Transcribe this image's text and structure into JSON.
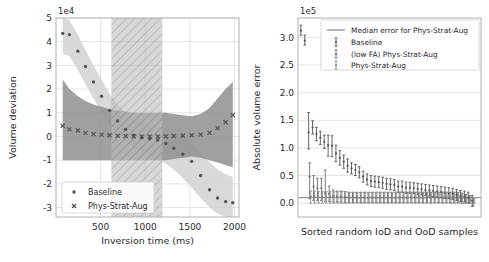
{
  "figure": {
    "background": "#ffffff",
    "width": 489,
    "height": 262
  },
  "chart_data": [
    {
      "id": "left",
      "type": "scatter",
      "title": "",
      "xlabel": "Inversion time (ms)",
      "ylabel": "Volume deviation",
      "x_exponent": "",
      "y_exponent": "1e4",
      "xlim": [
        0,
        2050
      ],
      "ylim": [
        -3.4,
        5.0
      ],
      "xticks": [
        500,
        1000,
        1500,
        2000
      ],
      "xticklabels": [
        "500",
        "1000",
        "1500",
        "2000"
      ],
      "yticks": [
        -3,
        -2,
        -1,
        0,
        1,
        2,
        3,
        4,
        5
      ],
      "yticklabels": [
        "-3",
        "-2",
        "-1",
        "0",
        "1",
        "2",
        "3",
        "4",
        "5"
      ],
      "grid": true,
      "legend_position": "lower left",
      "hatched_region": {
        "label": "training inversion time range",
        "x_start": 620,
        "x_end": 1190,
        "facecolor": "#bdbdbd",
        "hatch": "///"
      },
      "series": [
        {
          "name": "Baseline",
          "marker": "dot",
          "color": "#555555",
          "x": [
            75,
            150,
            245,
            330,
            420,
            510,
            600,
            690,
            780,
            870,
            960,
            1050,
            1140,
            1230,
            1320,
            1420,
            1520,
            1620,
            1720,
            1810,
            1900,
            1980
          ],
          "y": [
            4.35,
            4.3,
            3.6,
            2.95,
            2.3,
            1.7,
            1.1,
            0.65,
            0.3,
            0.05,
            -0.05,
            -0.1,
            -0.15,
            -0.3,
            -0.5,
            -0.75,
            -1.05,
            -1.65,
            -2.25,
            -2.6,
            -2.75,
            -2.8
          ],
          "band": {
            "name": "Baseline spread",
            "color": "#d2d2d2",
            "upper": [
              5.0,
              4.9,
              4.3,
              3.65,
              3.0,
              2.4,
              1.8,
              1.35,
              1.0,
              0.75,
              0.6,
              0.5,
              0.45,
              0.35,
              0.2,
              0.0,
              -0.3,
              -0.7,
              -1.1,
              -1.4,
              -1.6,
              -1.7
            ],
            "lower": [
              3.5,
              3.4,
              2.8,
              2.2,
              1.6,
              1.05,
              0.5,
              0.1,
              -0.25,
              -0.5,
              -0.65,
              -0.8,
              -0.95,
              -1.15,
              -1.4,
              -1.75,
              -2.15,
              -2.6,
              -3.0,
              -3.25,
              -3.4,
              -3.4
            ]
          }
        },
        {
          "name": "Phys-Strat-Aug",
          "marker": "x",
          "color": "#555555",
          "x": [
            75,
            150,
            245,
            330,
            420,
            510,
            600,
            690,
            780,
            870,
            960,
            1050,
            1140,
            1230,
            1320,
            1420,
            1520,
            1620,
            1720,
            1810,
            1900,
            1980
          ],
          "y": [
            0.45,
            0.3,
            0.25,
            0.15,
            0.1,
            0.08,
            0.05,
            0.03,
            0.02,
            0.0,
            0.0,
            0.0,
            0.0,
            0.0,
            0.02,
            0.03,
            0.05,
            0.08,
            0.15,
            0.35,
            0.6,
            0.9
          ],
          "band": {
            "name": "Phys-Strat-Aug spread",
            "color": "#8f8f8f",
            "upper": [
              2.4,
              2.0,
              1.7,
              1.5,
              1.35,
              1.25,
              1.15,
              1.1,
              1.05,
              1.0,
              1.0,
              1.0,
              1.0,
              1.0,
              0.95,
              0.9,
              0.85,
              0.95,
              1.2,
              1.6,
              2.0,
              2.3
            ],
            "lower": [
              -1.0,
              -1.0,
              -1.0,
              -1.0,
              -1.0,
              -1.0,
              -1.0,
              -1.0,
              -1.0,
              -1.0,
              -1.0,
              -1.0,
              -1.0,
              -1.0,
              -0.95,
              -0.9,
              -0.85,
              -0.9,
              -1.0,
              -1.1,
              -1.2,
              -1.3
            ]
          }
        }
      ],
      "legend": [
        {
          "label": "Baseline",
          "marker": "dot"
        },
        {
          "label": "Phys-Strat-Aug",
          "marker": "x"
        }
      ]
    },
    {
      "id": "right",
      "type": "scatter",
      "title": "",
      "xlabel": "Sorted random IoD and OoD samples",
      "ylabel": "Absolute volume error",
      "x_exponent": "",
      "y_exponent": "1e5",
      "xlim": [
        0,
        47
      ],
      "ylim": [
        -0.25,
        3.35
      ],
      "xticks": [],
      "xticklabels": [],
      "yticks": [
        0.0,
        0.5,
        1.0,
        1.5,
        2.0,
        2.5,
        3.0
      ],
      "yticklabels": [
        "0.0",
        "0.5",
        "1.0",
        "1.5",
        "2.0",
        "2.5",
        "3.0"
      ],
      "grid": true,
      "legend_position": "upper right",
      "median_line": {
        "label": "Median error for Phys-Strat-Aug",
        "value": 0.1,
        "color": "#7a7a7a"
      },
      "series": [
        {
          "name": "Baseline",
          "color": "#555555",
          "x": [
            1,
            2,
            3,
            4,
            5,
            6,
            7,
            8,
            9,
            10,
            11,
            12,
            13,
            14,
            15,
            16,
            17,
            18,
            19,
            20,
            21,
            22,
            23,
            24,
            25,
            26,
            27,
            28,
            29,
            30,
            31,
            32,
            33,
            34,
            35,
            36,
            37,
            38,
            39,
            40,
            41,
            42,
            43,
            44,
            45
          ],
          "y": [
            3.12,
            2.94,
            1.28,
            1.37,
            1.25,
            1.18,
            1.11,
            1.05,
            1.04,
            0.9,
            0.82,
            0.75,
            0.68,
            0.63,
            0.6,
            0.56,
            0.48,
            0.43,
            0.4,
            0.39,
            0.38,
            0.37,
            0.35,
            0.34,
            0.33,
            0.3,
            0.3,
            0.28,
            0.28,
            0.27,
            0.26,
            0.25,
            0.24,
            0.23,
            0.22,
            0.21,
            0.2,
            0.19,
            0.18,
            0.17,
            0.15,
            0.13,
            0.12,
            0.1,
            0.04
          ],
          "err_low": [
            0.08,
            0.08,
            0.3,
            0.12,
            0.12,
            0.12,
            0.12,
            0.2,
            0.2,
            0.15,
            0.13,
            0.12,
            0.12,
            0.1,
            0.1,
            0.1,
            0.1,
            0.1,
            0.1,
            0.1,
            0.1,
            0.1,
            0.1,
            0.1,
            0.1,
            0.1,
            0.1,
            0.1,
            0.1,
            0.1,
            0.1,
            0.1,
            0.1,
            0.1,
            0.1,
            0.1,
            0.1,
            0.1,
            0.1,
            0.1,
            0.1,
            0.1,
            0.1,
            0.1,
            0.1
          ],
          "err_high": [
            0.1,
            0.1,
            0.36,
            0.12,
            0.12,
            0.12,
            0.12,
            0.18,
            0.18,
            0.15,
            0.13,
            0.12,
            0.12,
            0.1,
            0.1,
            0.1,
            0.1,
            0.1,
            0.1,
            0.1,
            0.1,
            0.1,
            0.1,
            0.1,
            0.1,
            0.1,
            0.1,
            0.1,
            0.1,
            0.1,
            0.1,
            0.1,
            0.1,
            0.1,
            0.1,
            0.1,
            0.1,
            0.1,
            0.1,
            0.1,
            0.1,
            0.1,
            0.1,
            0.1,
            0.1
          ]
        },
        {
          "name": "(low FA) Phys-Strat-Aug",
          "color": "#6e6e6e",
          "x": [
            3,
            4,
            5,
            6,
            7,
            8,
            9,
            10,
            11,
            12,
            13,
            14,
            15,
            16,
            17,
            18,
            19,
            20,
            21,
            22,
            23,
            24,
            25,
            26,
            27,
            28,
            29,
            30,
            31,
            32,
            33,
            34,
            35,
            36,
            37,
            38,
            39,
            40,
            41,
            42,
            43,
            44,
            45
          ],
          "y": [
            0.48,
            0.3,
            0.27,
            0.27,
            0.18,
            0.17,
            0.13,
            0.12,
            0.12,
            0.11,
            0.1,
            0.1,
            0.1,
            0.1,
            0.1,
            0.1,
            0.1,
            0.1,
            0.1,
            0.1,
            0.1,
            0.1,
            0.1,
            0.1,
            0.1,
            0.1,
            0.1,
            0.1,
            0.1,
            0.1,
            0.1,
            0.1,
            0.1,
            0.1,
            0.1,
            0.1,
            0.1,
            0.1,
            0.1,
            0.09,
            0.08,
            0.07,
            0.02
          ],
          "err_low": [
            0.4,
            0.25,
            0.22,
            0.22,
            0.15,
            0.14,
            0.11,
            0.1,
            0.1,
            0.1,
            0.09,
            0.09,
            0.09,
            0.09,
            0.09,
            0.09,
            0.09,
            0.09,
            0.09,
            0.09,
            0.09,
            0.09,
            0.09,
            0.09,
            0.09,
            0.09,
            0.09,
            0.09,
            0.09,
            0.09,
            0.09,
            0.09,
            0.09,
            0.09,
            0.09,
            0.09,
            0.09,
            0.09,
            0.09,
            0.09,
            0.08,
            0.07,
            0.06
          ],
          "err_high": [
            0.25,
            0.2,
            0.18,
            0.18,
            0.42,
            0.14,
            0.11,
            0.1,
            0.1,
            0.1,
            0.09,
            0.09,
            0.09,
            0.09,
            0.09,
            0.09,
            0.09,
            0.09,
            0.09,
            0.09,
            0.09,
            0.09,
            0.09,
            0.09,
            0.09,
            0.09,
            0.09,
            0.09,
            0.09,
            0.09,
            0.09,
            0.09,
            0.09,
            0.09,
            0.09,
            0.09,
            0.09,
            0.09,
            0.09,
            0.09,
            0.08,
            0.07,
            0.06
          ]
        },
        {
          "name": "Phys-Strat-Aug",
          "color": "#8c8c8c",
          "x": [
            3,
            4,
            5,
            6,
            7,
            8,
            9,
            10,
            11,
            12,
            13,
            14,
            15,
            16,
            17,
            18,
            19,
            20,
            21,
            22,
            23,
            24,
            25,
            26,
            27,
            28,
            29,
            30,
            31,
            32,
            33,
            34,
            35,
            36,
            37,
            38,
            39,
            40,
            41,
            42,
            43,
            44,
            45
          ],
          "y": [
            0.12,
            0.12,
            0.11,
            0.11,
            0.11,
            0.11,
            0.11,
            0.11,
            0.11,
            0.11,
            0.1,
            0.1,
            0.1,
            0.1,
            0.1,
            0.1,
            0.1,
            0.1,
            0.1,
            0.1,
            0.1,
            0.1,
            0.1,
            0.1,
            0.1,
            0.1,
            0.1,
            0.1,
            0.1,
            0.1,
            0.1,
            0.1,
            0.1,
            0.1,
            0.1,
            0.1,
            0.1,
            0.1,
            0.1,
            0.09,
            0.08,
            0.06,
            0.03
          ],
          "err_low": [
            0.12,
            0.12,
            0.11,
            0.11,
            0.11,
            0.11,
            0.11,
            0.11,
            0.11,
            0.11,
            0.1,
            0.1,
            0.1,
            0.1,
            0.1,
            0.1,
            0.1,
            0.1,
            0.1,
            0.1,
            0.1,
            0.1,
            0.1,
            0.1,
            0.1,
            0.1,
            0.1,
            0.1,
            0.1,
            0.1,
            0.1,
            0.1,
            0.1,
            0.1,
            0.1,
            0.1,
            0.1,
            0.1,
            0.1,
            0.09,
            0.08,
            0.06,
            0.03
          ],
          "err_high": [
            0.1,
            0.1,
            0.1,
            0.1,
            0.1,
            0.1,
            0.1,
            0.1,
            0.1,
            0.1,
            0.1,
            0.1,
            0.1,
            0.1,
            0.1,
            0.1,
            0.1,
            0.1,
            0.1,
            0.1,
            0.1,
            0.1,
            0.1,
            0.1,
            0.1,
            0.1,
            0.1,
            0.1,
            0.1,
            0.1,
            0.1,
            0.1,
            0.1,
            0.1,
            0.1,
            0.1,
            0.1,
            0.1,
            0.1,
            0.09,
            0.08,
            0.07,
            0.05
          ]
        }
      ],
      "legend": [
        {
          "label": "Median error for Phys-Strat-Aug",
          "marker": "line"
        },
        {
          "label": "Baseline",
          "marker": "errorbar"
        },
        {
          "label": "(low FA) Phys-Strat-Aug",
          "marker": "errorbar"
        },
        {
          "label": "Phys-Strat-Aug",
          "marker": "errorbar"
        }
      ]
    }
  ]
}
